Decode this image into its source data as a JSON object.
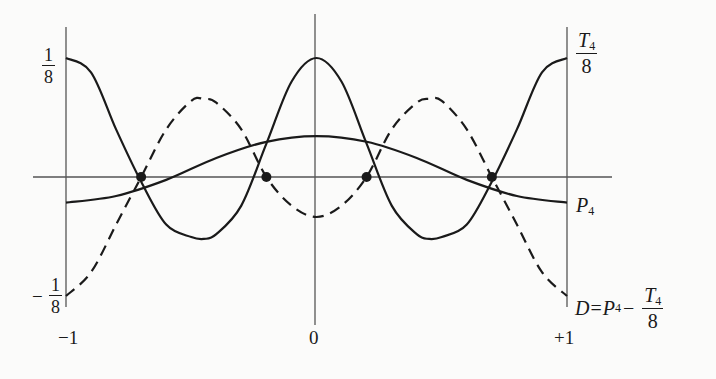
{
  "chart_data": {
    "type": "line",
    "title": "",
    "xlabel": "",
    "ylabel": "",
    "xlim": [
      -1,
      1
    ],
    "ylim": [
      -0.125,
      0.125
    ],
    "grid": false,
    "legend": "inline labels at right edge",
    "x_tick_labels": [
      "-1",
      "0",
      "+1"
    ],
    "y_tick_labels": [
      "1/8",
      "-1/8"
    ],
    "series": [
      {
        "name": "T4/8",
        "style": "solid",
        "x": [
          -1,
          -0.9,
          -0.8,
          -0.7,
          -0.6,
          -0.5,
          -0.45,
          -0.4,
          -0.3,
          -0.2,
          -0.1,
          0,
          0.1,
          0.2,
          0.3,
          0.4,
          0.45,
          0.5,
          0.6,
          0.7,
          0.8,
          0.9,
          1
        ],
        "values": [
          0.125,
          0.11,
          0.05,
          -0.005,
          -0.05,
          -0.063,
          -0.065,
          -0.06,
          -0.03,
          0.035,
          0.1,
          0.125,
          0.1,
          0.035,
          -0.03,
          -0.06,
          -0.065,
          -0.063,
          -0.05,
          -0.005,
          0.05,
          0.11,
          0.125
        ]
      },
      {
        "name": "P4",
        "style": "solid",
        "x": [
          -1,
          -0.8,
          -0.6,
          -0.4,
          -0.2,
          0,
          0.2,
          0.4,
          0.6,
          0.8,
          1
        ],
        "values": [
          -0.027,
          -0.02,
          -0.003,
          0.02,
          0.037,
          0.043,
          0.037,
          0.02,
          -0.003,
          -0.02,
          -0.027
        ]
      },
      {
        "name": "D = P4 - T4/8",
        "style": "dashed",
        "x": [
          -1,
          -0.9,
          -0.8,
          -0.7,
          -0.6,
          -0.5,
          -0.45,
          -0.4,
          -0.3,
          -0.2,
          -0.1,
          0,
          0.1,
          0.2,
          0.3,
          0.4,
          0.45,
          0.5,
          0.6,
          0.7,
          0.8,
          0.9,
          1
        ],
        "values": [
          -0.125,
          -0.1,
          -0.05,
          0.0,
          0.05,
          0.08,
          0.082,
          0.078,
          0.05,
          0.0,
          -0.03,
          -0.042,
          -0.03,
          0.0,
          0.05,
          0.078,
          0.082,
          0.08,
          0.05,
          0.0,
          -0.05,
          -0.1,
          -0.125
        ]
      }
    ],
    "markers": {
      "description": "zeros of D (intersections of P4 and T4/8)",
      "x": [
        -0.7,
        -0.2,
        0.2,
        0.7
      ],
      "y": [
        0,
        0,
        0,
        0
      ]
    },
    "annotations": [
      "T4/8",
      "P4",
      "D = P4 - T4/8"
    ]
  },
  "labels": {
    "y_top": {
      "num": "1",
      "den": "8"
    },
    "y_bottom": {
      "sign": "−",
      "num": "1",
      "den": "8"
    },
    "x_left": "−1",
    "x_center": "0",
    "x_right": "+1",
    "t4_label": {
      "num_var": "T",
      "num_sub": "4",
      "den": "8"
    },
    "p4_label": {
      "var": "P",
      "sub": "4"
    },
    "d_label": {
      "lhs": "D",
      "eq": "=",
      "var": "P",
      "sub": "4",
      "op": "−",
      "frac_var": "T",
      "frac_sub": "4",
      "frac_den": "8"
    }
  },
  "colors": {
    "ink": "#1a1a1a",
    "axis": "#555555",
    "background": "#fbfbfa"
  }
}
